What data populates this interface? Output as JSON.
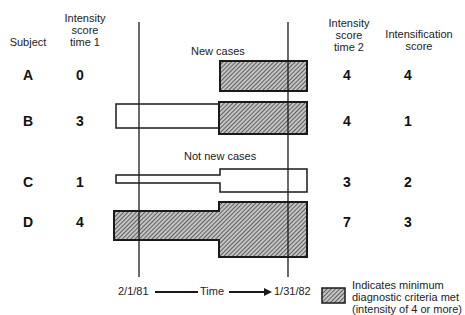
{
  "headers": {
    "subject": "Subject",
    "time1": "Intensity score time 1",
    "time1_lines": [
      "Intensity",
      "score",
      "time 1"
    ],
    "time2_lines": [
      "Intensity",
      "score",
      "time 2"
    ],
    "intensification_lines": [
      "Intensification",
      "score"
    ]
  },
  "groups": {
    "new_cases": "New cases",
    "not_new_cases": "Not new cases"
  },
  "subjects": [
    {
      "id": "A",
      "time1": "0",
      "time2": "4",
      "intensification": "4",
      "group": "new"
    },
    {
      "id": "B",
      "time1": "3",
      "time2": "4",
      "intensification": "1",
      "group": "new"
    },
    {
      "id": "C",
      "time1": "1",
      "time2": "3",
      "intensification": "2",
      "group": "not_new"
    },
    {
      "id": "D",
      "time1": "4",
      "time2": "7",
      "intensification": "3",
      "group": "not_new"
    }
  ],
  "axis": {
    "start": "2/1/81",
    "label": "Time",
    "end": "1/31/82"
  },
  "legend": {
    "lines": [
      "Indicates minimum",
      "diagnostic criteria met",
      "(intensity of 4 or more)"
    ]
  },
  "colors": {
    "ink": "#1a1a1a",
    "hatch_bg": "#bdbdbd",
    "paper": "#ffffff"
  }
}
